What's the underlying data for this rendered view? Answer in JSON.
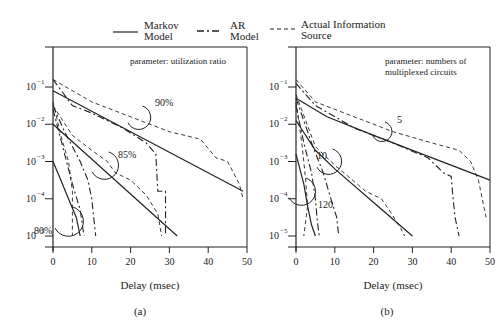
{
  "legend": {
    "items": [
      {
        "label_line1": "Markov",
        "label_line2": "Model",
        "style": "solid"
      },
      {
        "label_line1": "AR",
        "label_line2": "Model",
        "style": "dashdot"
      },
      {
        "label_line1": "Actual Information",
        "label_line2": "Source",
        "style": "dashed"
      }
    ]
  },
  "chart_data": [
    {
      "type": "line",
      "panel_label": "(a)",
      "annotation": "parameter: utilization ratio",
      "xlabel": "Delay (msec)",
      "ylabel": "",
      "xlim": [
        0,
        50
      ],
      "ylim_log10": [
        -5,
        -1
      ],
      "xticks": [
        0,
        10,
        20,
        30,
        40,
        50
      ],
      "xtick_labels": [
        "0",
        "10",
        "20",
        "30",
        "40",
        "50"
      ],
      "yticks_log10": [
        -1,
        -2,
        -3,
        -4,
        -5
      ],
      "ytick_labels": [
        "10",
        "10",
        "10",
        "10",
        "10"
      ],
      "ytick_exponents": [
        "−1",
        "−2",
        "−3",
        "−4",
        "−5"
      ],
      "grid": false,
      "groups": [
        {
          "param_label": "90%",
          "series": [
            {
              "name": "Markov Model",
              "style": "solid",
              "points": [
                [
                  0,
                  -1.1
                ],
                [
                  49,
                  -3.8
                ]
              ]
            },
            {
              "name": "AR Model",
              "style": "dashdot",
              "points": [
                [
                  0,
                  -0.8
                ],
                [
                  5,
                  -1.5
                ],
                [
                  10,
                  -1.7
                ],
                [
                  18,
                  -2.1
                ],
                [
                  24,
                  -2.5
                ],
                [
                  26.5,
                  -2.8
                ],
                [
                  27,
                  -3.8
                ],
                [
                  29,
                  -3.8
                ],
                [
                  29,
                  -5
                ]
              ]
            },
            {
              "name": "Actual Information Source",
              "style": "dashed",
              "points": [
                [
                  0,
                  -0.8
                ],
                [
                  10,
                  -1.4
                ],
                [
                  20,
                  -1.8
                ],
                [
                  30,
                  -2.2
                ],
                [
                  38,
                  -2.4
                ],
                [
                  42,
                  -2.9
                ],
                [
                  45,
                  -3.0
                ],
                [
                  48,
                  -3.6
                ],
                [
                  49,
                  -4.0
                ]
              ]
            }
          ]
        },
        {
          "param_label": "85%",
          "series": [
            {
              "name": "Markov Model",
              "style": "solid",
              "points": [
                [
                  0,
                  -2.0
                ],
                [
                  32,
                  -5
                ]
              ]
            },
            {
              "name": "AR Model",
              "style": "dashdot",
              "points": [
                [
                  0,
                  -1.5
                ],
                [
                  3,
                  -2.2
                ],
                [
                  7,
                  -3.0
                ],
                [
                  9,
                  -3.5
                ],
                [
                  10,
                  -4.0
                ],
                [
                  10.5,
                  -4.5
                ],
                [
                  11,
                  -5
                ]
              ]
            },
            {
              "name": "Actual Information Source",
              "style": "dashed",
              "points": [
                [
                  0,
                  -1.5
                ],
                [
                  5,
                  -2.3
                ],
                [
                  10,
                  -2.7
                ],
                [
                  14,
                  -3.0
                ],
                [
                  16,
                  -3.3
                ],
                [
                  20,
                  -3.5
                ],
                [
                  24,
                  -3.9
                ],
                [
                  27,
                  -4.4
                ],
                [
                  28,
                  -5
                ]
              ]
            }
          ]
        },
        {
          "param_label": "80%",
          "series": [
            {
              "name": "Markov Model",
              "style": "solid",
              "points": [
                [
                  0,
                  -3.0
                ],
                [
                  2,
                  -3.5
                ],
                [
                  4,
                  -4.0
                ],
                [
                  6,
                  -4.5
                ],
                [
                  7,
                  -5
                ]
              ]
            },
            {
              "name": "AR Model",
              "style": "dashdot",
              "points": [
                [
                  0,
                  -1.6
                ],
                [
                  3,
                  -2.8
                ],
                [
                  5,
                  -3.6
                ],
                [
                  7,
                  -4.3
                ],
                [
                  8,
                  -5
                ]
              ]
            },
            {
              "name": "Actual Information Source",
              "style": "dashed",
              "points": [
                [
                  0,
                  -1.4
                ],
                [
                  2,
                  -2.3
                ],
                [
                  4,
                  -3.0
                ],
                [
                  5,
                  -3.8
                ],
                [
                  5,
                  -5
                ]
              ]
            }
          ]
        }
      ]
    },
    {
      "type": "line",
      "panel_label": "(b)",
      "annotation_line1": "parameter: numbers of",
      "annotation_line2": "multiplexed circuits",
      "xlabel": "Delay (msec)",
      "ylabel": "",
      "xlim": [
        0,
        50
      ],
      "ylim_log10": [
        -5,
        -1
      ],
      "xticks": [
        0,
        10,
        20,
        30,
        40,
        50
      ],
      "xtick_labels": [
        "0",
        "10",
        "20",
        "30",
        "40",
        "50"
      ],
      "yticks_log10": [
        -1,
        -2,
        -3,
        -4,
        -5
      ],
      "ytick_labels": [
        "10",
        "10",
        "10",
        "10",
        "10"
      ],
      "ytick_exponents": [
        "−1",
        "−2",
        "−3",
        "−4",
        "−5"
      ],
      "grid": false,
      "groups": [
        {
          "param_label": "5",
          "series": [
            {
              "name": "Markov Model",
              "style": "solid",
              "points": [
                [
                  0,
                  -1.3
                ],
                [
                  8,
                  -1.8
                ],
                [
                  20,
                  -2.3
                ],
                [
                  50,
                  -3.5
                ]
              ]
            },
            {
              "name": "AR Model",
              "style": "dashdot",
              "points": [
                [
                  0,
                  -0.9
                ],
                [
                  5,
                  -1.5
                ],
                [
                  15,
                  -2.1
                ],
                [
                  25,
                  -2.5
                ],
                [
                  34,
                  -2.9
                ],
                [
                  38,
                  -3.3
                ],
                [
                  40,
                  -3.4
                ],
                [
                  40.5,
                  -4.0
                ],
                [
                  41,
                  -4.5
                ],
                [
                  42,
                  -5
                ]
              ]
            },
            {
              "name": "Actual Information Source",
              "style": "dashed",
              "points": [
                [
                  0,
                  -0.8
                ],
                [
                  5,
                  -1.4
                ],
                [
                  15,
                  -1.8
                ],
                [
                  25,
                  -2.2
                ],
                [
                  35,
                  -2.5
                ],
                [
                  42,
                  -2.7
                ],
                [
                  45,
                  -3.0
                ],
                [
                  47,
                  -3.5
                ],
                [
                  49,
                  -4.5
                ]
              ]
            }
          ]
        },
        {
          "param_label": "10",
          "series": [
            {
              "name": "Markov Model",
              "style": "solid",
              "points": [
                [
                  0,
                  -1.9
                ],
                [
                  5,
                  -2.7
                ],
                [
                  10,
                  -3.2
                ],
                [
                  20,
                  -4.1
                ],
                [
                  30,
                  -5
                ]
              ]
            },
            {
              "name": "AR Model",
              "style": "dashdot",
              "points": [
                [
                  0,
                  -1.3
                ],
                [
                  4,
                  -2.5
                ],
                [
                  7,
                  -3.3
                ],
                [
                  9,
                  -4.0
                ],
                [
                  10.5,
                  -4.5
                ],
                [
                  11,
                  -5
                ]
              ]
            },
            {
              "name": "Actual Information Source",
              "style": "dashed",
              "points": [
                [
                  0,
                  -1.2
                ],
                [
                  5,
                  -2.6
                ],
                [
                  10,
                  -3.1
                ],
                [
                  18,
                  -3.8
                ],
                [
                  22,
                  -4.0
                ],
                [
                  24,
                  -4.3
                ],
                [
                  27,
                  -4.8
                ],
                [
                  28,
                  -5
                ]
              ]
            }
          ]
        },
        {
          "param_label": "120",
          "series": [
            {
              "name": "Markov Model",
              "style": "solid",
              "points": [
                [
                  0,
                  -2.8
                ],
                [
                  2,
                  -3.6
                ],
                [
                  3,
                  -4.2
                ],
                [
                  4,
                  -4.7
                ],
                [
                  5,
                  -5
                ]
              ]
            },
            {
              "name": "AR Model",
              "style": "dashdot",
              "points": [
                [
                  0,
                  -1.5
                ],
                [
                  2,
                  -2.5
                ],
                [
                  4,
                  -3.3
                ],
                [
                  5,
                  -4.0
                ],
                [
                  5.5,
                  -4.6
                ],
                [
                  6,
                  -5
                ]
              ]
            },
            {
              "name": "Actual Information Source",
              "style": "dashed",
              "points": [
                [
                  0,
                  -1.4
                ],
                [
                  1.5,
                  -2.5
                ],
                [
                  2.5,
                  -3.5
                ],
                [
                  3,
                  -4.2
                ],
                [
                  2,
                  -5
                ]
              ]
            }
          ]
        }
      ]
    }
  ]
}
